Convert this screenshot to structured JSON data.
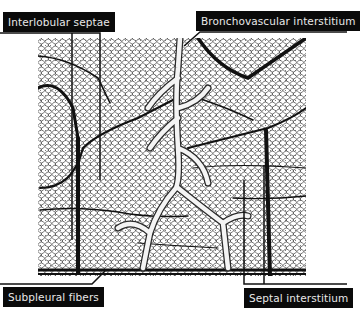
{
  "figure": {
    "colors": {
      "background": "#ffffff",
      "label_bg": "#0a0a0a",
      "label_text": "#e8e8e8",
      "leader_line": "#111111"
    }
  },
  "labels": {
    "interlobular_septae": "Interlobular septae",
    "bronchovascular_interstitium": "Bronchovascular interstitium",
    "subpleural_fibers": "Subpleural fibers",
    "septal_interstitium": "Septal interstitium"
  }
}
